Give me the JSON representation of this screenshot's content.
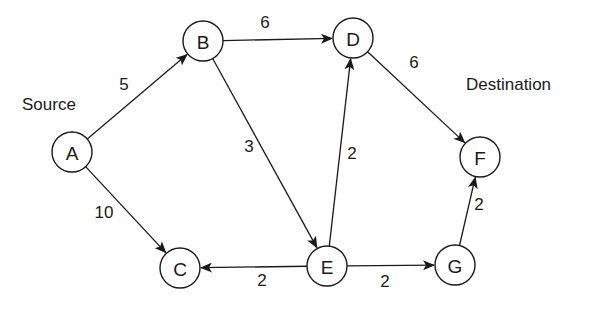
{
  "diagram": {
    "type": "directed-weighted-graph",
    "annotations": {
      "source": {
        "text": "Source",
        "x": 22,
        "y": 110
      },
      "destination": {
        "text": "Destination",
        "x": 466,
        "y": 90
      }
    },
    "node_radius": 20,
    "nodes": [
      {
        "id": "A",
        "label": "A",
        "x": 72,
        "y": 152
      },
      {
        "id": "B",
        "label": "B",
        "x": 203,
        "y": 41
      },
      {
        "id": "C",
        "label": "C",
        "x": 180,
        "y": 268
      },
      {
        "id": "D",
        "label": "D",
        "x": 353,
        "y": 38
      },
      {
        "id": "E",
        "label": "E",
        "x": 327,
        "y": 266
      },
      {
        "id": "F",
        "label": "F",
        "x": 480,
        "y": 157
      },
      {
        "id": "G",
        "label": "G",
        "x": 455,
        "y": 265
      }
    ],
    "edges": [
      {
        "from": "A",
        "to": "B",
        "weight": "5",
        "lx": 124,
        "ly": 84
      },
      {
        "from": "A",
        "to": "C",
        "weight": "10",
        "lx": 104,
        "ly": 212
      },
      {
        "from": "B",
        "to": "D",
        "weight": "6",
        "lx": 265,
        "ly": 22
      },
      {
        "from": "B",
        "to": "E",
        "weight": "3",
        "lx": 249,
        "ly": 146
      },
      {
        "from": "E",
        "to": "D",
        "weight": "2",
        "lx": 352,
        "ly": 153
      },
      {
        "from": "D",
        "to": "F",
        "weight": "6",
        "lx": 414,
        "ly": 62
      },
      {
        "from": "E",
        "to": "C",
        "weight": "2",
        "lx": 262,
        "ly": 280
      },
      {
        "from": "E",
        "to": "G",
        "weight": "2",
        "lx": 385,
        "ly": 281
      },
      {
        "from": "G",
        "to": "F",
        "weight": "2",
        "lx": 479,
        "ly": 204
      }
    ]
  }
}
